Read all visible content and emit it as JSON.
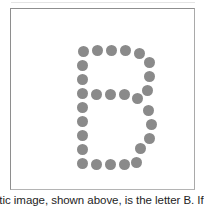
{
  "figure": {
    "name": "dot-matrix-letter-figure",
    "letter": "B",
    "alt_label": "Dot matrix rendering of the letter B",
    "dot_color": "#8a8a8a",
    "background_color": "#ffffff",
    "border_color": "#8e8e8e",
    "dot_diameter": 11,
    "dot_count": 28,
    "dots": [
      {
        "x": 67,
        "y": 37
      },
      {
        "x": 81,
        "y": 36
      },
      {
        "x": 95,
        "y": 36
      },
      {
        "x": 109,
        "y": 36
      },
      {
        "x": 123,
        "y": 39
      },
      {
        "x": 133,
        "y": 48
      },
      {
        "x": 66,
        "y": 51
      },
      {
        "x": 66,
        "y": 65
      },
      {
        "x": 66,
        "y": 79
      },
      {
        "x": 66,
        "y": 93
      },
      {
        "x": 66,
        "y": 107
      },
      {
        "x": 66,
        "y": 121
      },
      {
        "x": 66,
        "y": 135
      },
      {
        "x": 133,
        "y": 62
      },
      {
        "x": 131,
        "y": 76
      },
      {
        "x": 80,
        "y": 80
      },
      {
        "x": 94,
        "y": 80
      },
      {
        "x": 108,
        "y": 80
      },
      {
        "x": 121,
        "y": 84
      },
      {
        "x": 132,
        "y": 96
      },
      {
        "x": 135,
        "y": 110
      },
      {
        "x": 133,
        "y": 124
      },
      {
        "x": 124,
        "y": 134
      },
      {
        "x": 66,
        "y": 149
      },
      {
        "x": 80,
        "y": 150
      },
      {
        "x": 94,
        "y": 150
      },
      {
        "x": 108,
        "y": 150
      },
      {
        "x": 120,
        "y": 148
      }
    ]
  },
  "caption": {
    "text": "etic image, shown above, is the letter B. If yo",
    "note_clipped": true
  }
}
